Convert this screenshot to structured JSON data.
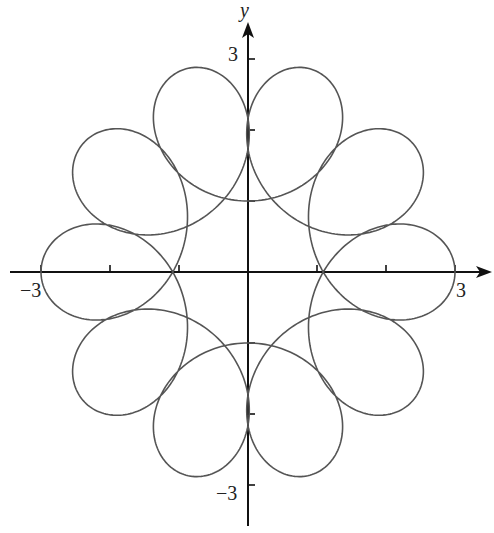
{
  "chart_data": {
    "type": "line",
    "title": "",
    "xlabel": "",
    "ylabel": "y",
    "xlim": [
      -3,
      3
    ],
    "ylim": [
      -3,
      3
    ],
    "grid": false,
    "x_ticks": [
      -3,
      -2,
      -1,
      1,
      2,
      3
    ],
    "y_ticks": [
      -3,
      -2,
      -1,
      1,
      2,
      3
    ],
    "tick_labels": {
      "x_neg": "−3",
      "x_pos": "3",
      "y_pos": "3",
      "y_neg": "−3"
    },
    "curve": {
      "description": "Closed parametric curve with 10 looped lobes; radius varies from 1 to 3",
      "form": "x = a*cos(t) + b*cos(k*t), y = a*sin(t) - b*sin(k*t)",
      "a": 2,
      "b": 1,
      "k": 9,
      "t_range": [
        0,
        6.2832
      ],
      "min_radius": 1,
      "max_radius": 3,
      "loop_count": 10,
      "stroke": "#555555"
    }
  },
  "axes": {
    "y_label": "y",
    "labels": {
      "x_neg": "−3",
      "x_pos": "3",
      "y_pos": "3",
      "y_neg": "−3"
    },
    "color": "#111111"
  }
}
